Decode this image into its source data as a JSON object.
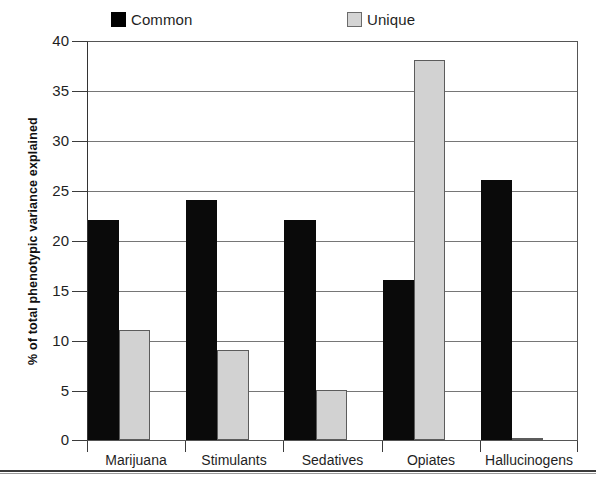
{
  "chart_data": {
    "type": "bar",
    "title": "",
    "subtitle": "",
    "xlabel": "",
    "ylabel": "% of total phenotypic variance explained",
    "ylim": [
      0,
      40
    ],
    "ytick_step": 5,
    "yticks": [
      "40",
      "35",
      "30",
      "25",
      "20",
      "15",
      "10",
      "5",
      "0"
    ],
    "ytick_values": [
      40,
      35,
      30,
      25,
      20,
      15,
      10,
      5,
      0
    ],
    "grid": true,
    "grid_axis": "y",
    "legend_position": "top",
    "categories": [
      "Marijuana",
      "Stimulants",
      "Sedatives",
      "Opiates",
      "Hallucinogens"
    ],
    "series": [
      {
        "name": "Common",
        "color": "#000000",
        "values": [
          22,
          24,
          22,
          16,
          26
        ]
      },
      {
        "name": "Unique",
        "color": "#d2d2d2",
        "values": [
          11,
          9,
          5,
          38,
          0.2
        ]
      }
    ]
  },
  "legend": {
    "items": [
      {
        "label": "Common",
        "swatch": "black-square-swatch"
      },
      {
        "label": "Unique",
        "swatch": "gray-square-swatch"
      }
    ]
  },
  "axes": {
    "y_title": "% of total phenotypic variance explained"
  }
}
